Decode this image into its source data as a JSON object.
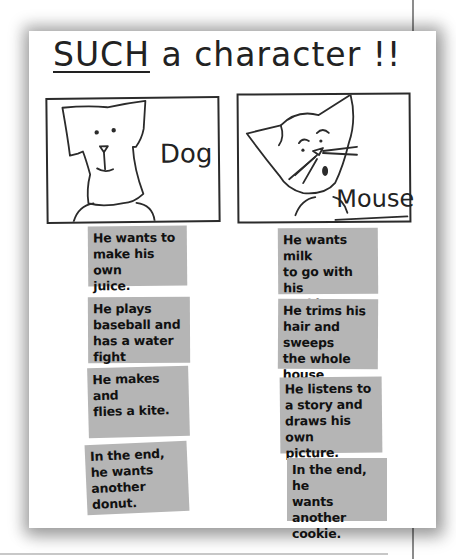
{
  "poster": {
    "title_emphasis": "SUCH",
    "title_rest": " a character !!",
    "colors": {
      "paper": "#ffffff",
      "card": "#b5b5b5",
      "ink": "#222222"
    }
  },
  "characters": [
    {
      "name": "Dog",
      "icon": "dog-drawing-icon",
      "cards": [
        "He wants to\nmake his own\njuice.",
        "He plays\nbaseball and\nhas a water fight",
        "He makes and\nflies a kite.",
        "In the end,\nhe wants\nanother donut."
      ]
    },
    {
      "name": "Mouse",
      "icon": "mouse-drawing-icon",
      "cards": [
        "He wants milk\nto go with his\ncookie.",
        "He trims his\nhair and sweeps\nthe whole house",
        "He listens to\na story and\ndraws his own\npicture.",
        "In the end, he\nwants another\ncookie."
      ]
    }
  ]
}
